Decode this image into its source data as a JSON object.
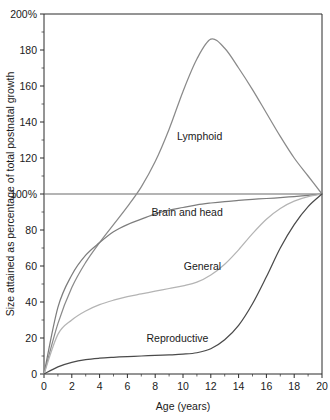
{
  "chart_data": {
    "type": "line",
    "title": "",
    "xlabel": "Age (years)",
    "ylabel": "Size attained as percentage of total postnatal growth",
    "xlim": [
      0,
      20
    ],
    "ylim": [
      0,
      200
    ],
    "grid": false,
    "legend_position": "inline-labels",
    "x_ticks": [
      0,
      2,
      4,
      6,
      8,
      10,
      12,
      14,
      16,
      18,
      20
    ],
    "x_tick_labels": [
      "0",
      "2",
      "4",
      "6",
      "8",
      "10",
      "12",
      "14",
      "16",
      "18",
      "20"
    ],
    "x_minor_ticks": [
      1,
      3,
      5,
      7,
      9,
      11,
      13,
      15,
      17,
      19
    ],
    "y_ticks": [
      0,
      20,
      40,
      60,
      80,
      100,
      120,
      140,
      160,
      180,
      200
    ],
    "y_tick_labels": [
      "0",
      "20",
      "40",
      "60",
      "80",
      "100%",
      "120",
      "140",
      "160",
      "180",
      "200%"
    ],
    "y_minor_ticks": [
      10,
      30,
      50,
      70,
      90,
      110,
      130,
      150,
      170,
      190
    ],
    "reference_line_y": 100,
    "x": [
      0,
      1,
      2,
      3,
      4,
      5,
      6,
      7,
      8,
      9,
      10,
      11,
      12,
      13,
      14,
      15,
      16,
      17,
      18,
      19,
      20
    ],
    "series": [
      {
        "name": "Lymphoid",
        "color": "#8a8a8a",
        "label_x": 11.2,
        "label_y": 130,
        "values": [
          0,
          28,
          48,
          62,
          73,
          83,
          93,
          104,
          118,
          136,
          157,
          175,
          186,
          181,
          170,
          158,
          145,
          132,
          120,
          110,
          100
        ]
      },
      {
        "name": "Brain and head",
        "color": "#7d7d7d",
        "label_x": 10.3,
        "label_y": 88,
        "values": [
          0,
          37,
          55,
          66,
          73,
          79,
          83,
          86,
          89,
          91,
          92.5,
          94,
          95,
          95.8,
          96.4,
          97,
          97.5,
          98,
          98.6,
          99.3,
          100
        ]
      },
      {
        "name": "General",
        "color": "#b4b4b4",
        "label_x": 11.4,
        "label_y": 58,
        "values": [
          0,
          22,
          30,
          35,
          38.5,
          41,
          43,
          44.5,
          46,
          47.5,
          49,
          51,
          55,
          61,
          69,
          78,
          86,
          92,
          96,
          98.5,
          100
        ]
      },
      {
        "name": "Reproductive",
        "color": "#4a4a4a",
        "label_x": 9.6,
        "label_y": 18,
        "values": [
          0,
          4,
          6.5,
          8,
          8.8,
          9.3,
          9.7,
          10,
          10.3,
          10.6,
          11,
          11.8,
          14,
          19,
          27,
          39,
          54,
          70,
          83,
          93,
          100
        ]
      }
    ]
  }
}
